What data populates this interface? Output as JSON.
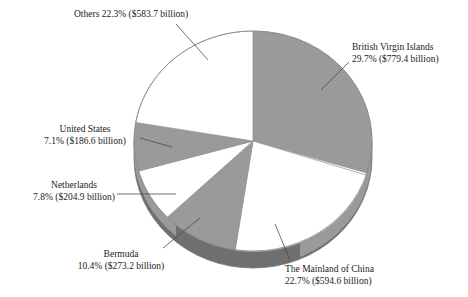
{
  "chart_data": {
    "type": "pie",
    "title": "",
    "subtitle": "",
    "xlabel": "",
    "ylabel": "",
    "legend_position": "none",
    "grid": false,
    "units": "billion USD",
    "start_angle_deg": 0,
    "direction": "clockwise",
    "style": "3d-pie",
    "categories": [
      "British Virgin Islands",
      "The Mainland of China",
      "Bermuda",
      "Netherlands",
      "United States",
      "Others"
    ],
    "values": [
      29.7,
      22.7,
      10.4,
      7.8,
      7.1,
      22.3
    ],
    "amounts": [
      779.4,
      594.6,
      273.2,
      204.9,
      186.6,
      583.7
    ],
    "slices": [
      {
        "name": "British Virgin Islands",
        "percent": 29.7,
        "amount": 779.4,
        "percent_label": "29.7%",
        "amount_label": "($779.4 billion)",
        "color": "#9a9a9a",
        "side_color": "#6f6f6f"
      },
      {
        "name": "The Mainland of China",
        "percent": 22.7,
        "amount": 594.6,
        "percent_label": "22.7%",
        "amount_label": "($594.6 billion)",
        "color": "#ffffff",
        "side_color": "#9a9a9a"
      },
      {
        "name": "Bermuda",
        "percent": 10.4,
        "amount": 273.2,
        "percent_label": "10.4%",
        "amount_label": "($273.2 billion)",
        "color": "#9a9a9a",
        "side_color": "#6f6f6f"
      },
      {
        "name": "Netherlands",
        "percent": 7.8,
        "amount": 204.9,
        "percent_label": "7.8%",
        "amount_label": "($204.9 billion)",
        "color": "#ffffff",
        "side_color": "#9a9a9a"
      },
      {
        "name": "United States",
        "percent": 7.1,
        "amount": 186.6,
        "percent_label": "7.1%",
        "amount_label": "($186.6 billion)",
        "color": "#9a9a9a",
        "side_color": "#6f6f6f"
      },
      {
        "name": "Others",
        "percent": 22.3,
        "amount": 583.7,
        "percent_label": "22.3%",
        "amount_label": "($583.7 billion)",
        "color": "#ffffff",
        "side_color": "#9a9a9a"
      }
    ]
  },
  "labels": {
    "others": {
      "line1": "Others 22.3% ($583.7 billion)",
      "line2": ""
    },
    "british_virgin_islands": {
      "line1": "British Virgin Islands",
      "line2": "29.7% ($779.4 billion)"
    },
    "united_states": {
      "line1": "United States",
      "line2": "7.1% ($186.6 billion)"
    },
    "netherlands": {
      "line1": "Netherlands",
      "line2": "7.8% ($204.9 billion)"
    },
    "bermuda": {
      "line1": "Bermuda",
      "line2": "10.4% ($273.2 billion)"
    },
    "mainland_china": {
      "line1": "The Mainland of China",
      "line2": "22.7% ($594.6 billion)"
    }
  },
  "colors": {
    "slice_gray": "#9a9a9a",
    "slice_white": "#ffffff",
    "side_dark": "#6f6f6f",
    "outline": "#8a8a8a",
    "leader_line": "#4a4a4a",
    "text": "#1b1b1b",
    "background": "#ffffff"
  }
}
